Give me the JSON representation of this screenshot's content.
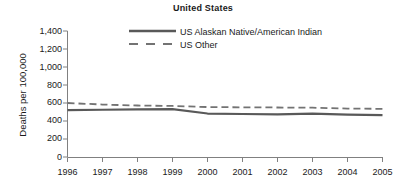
{
  "chart_data": {
    "type": "line",
    "title": "United States",
    "xlabel": "",
    "ylabel": "Deaths per 100,000",
    "x": [
      1996,
      1997,
      1998,
      1999,
      2000,
      2001,
      2002,
      2003,
      2004,
      2005
    ],
    "categories": [
      "1996",
      "1997",
      "1998",
      "1999",
      "2000",
      "2001",
      "2002",
      "2003",
      "2004",
      "2005"
    ],
    "ylim": [
      0,
      1400
    ],
    "yticks": [
      0,
      200,
      400,
      600,
      800,
      1000,
      1200,
      1400
    ],
    "ytick_labels": [
      "0",
      "200",
      "400",
      "600",
      "800",
      "1,000",
      "1,200",
      "1,400"
    ],
    "grid": false,
    "legend_position": "top-center",
    "series": [
      {
        "name": "US Alaskan Native/American Indian",
        "style": "solid",
        "color": "#595959",
        "values": [
          520,
          525,
          530,
          532,
          483,
          478,
          474,
          482,
          470,
          465
        ]
      },
      {
        "name": "US Other",
        "style": "dashed",
        "color": "#737373",
        "values": [
          600,
          583,
          572,
          567,
          555,
          552,
          550,
          548,
          538,
          535
        ]
      }
    ]
  },
  "legend": {
    "items": [
      {
        "label": "US Alaskan Native/American Indian"
      },
      {
        "label": "US Other"
      }
    ]
  }
}
